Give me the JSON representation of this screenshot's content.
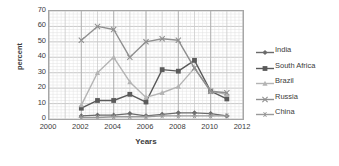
{
  "chart_data": {
    "type": "line",
    "title": "",
    "xlabel": "Years",
    "ylabel": "percent",
    "xlim": [
      2000,
      2012
    ],
    "ylim": [
      0,
      70
    ],
    "xticks": [
      2000,
      2002,
      2004,
      2006,
      2008,
      2010,
      2012
    ],
    "yticks": [
      0,
      10,
      20,
      30,
      40,
      50,
      60,
      70
    ],
    "grid": true,
    "legend_position": "right",
    "x": [
      2002,
      2003,
      2004,
      2005,
      2006,
      2007,
      2008,
      2009,
      2010,
      2011
    ],
    "series": [
      {
        "name": "India",
        "color": "#6b6b6b",
        "marker": "diamond",
        "values": [
          2,
          2.5,
          2.5,
          3.5,
          2,
          3,
          4,
          4,
          3.5,
          2
        ]
      },
      {
        "name": "South Africa",
        "color": "#5a5a5a",
        "marker": "square",
        "values": [
          7,
          12,
          12,
          16,
          11,
          32,
          31,
          38,
          18,
          13
        ]
      },
      {
        "name": "Brazil",
        "color": "#b4b4b4",
        "marker": "triangle",
        "values": [
          9,
          30,
          40,
          24,
          14,
          17,
          21,
          33,
          18,
          16
        ]
      },
      {
        "name": "Russia",
        "color": "#8f8f8f",
        "marker": "cross",
        "values": [
          51,
          60,
          58,
          40,
          50,
          52,
          51,
          33,
          18,
          17
        ]
      },
      {
        "name": "China",
        "color": "#9a9a9a",
        "marker": "star",
        "values": [
          1,
          1,
          1.5,
          1.5,
          1.5,
          2,
          2,
          2,
          2,
          2
        ]
      }
    ]
  }
}
